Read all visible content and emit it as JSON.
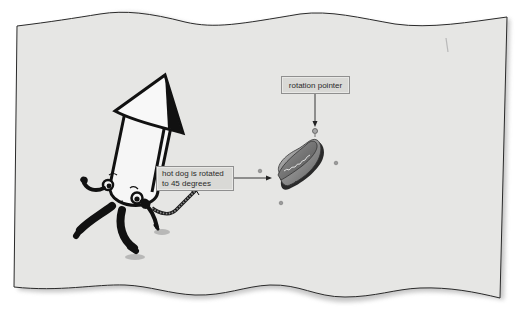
{
  "figure": {
    "paper_color": "#e6e6e4",
    "border_color": "#2a2a2a",
    "shadow_color": "#9a9a9a",
    "callouts": [
      {
        "id": "rotation",
        "label": "rotation pointer"
      },
      {
        "id": "hotdog",
        "lines": [
          "hot dog is rotated",
          "to 45 degrees"
        ]
      }
    ],
    "characters": [
      {
        "name": "firecracker-rocket",
        "description": "cartoon firecracker rocket with cone hat, eyes, arms, legs and lit fuse"
      },
      {
        "name": "hot-dog",
        "description": "hot dog in bun with mustard, rotated 45 degrees"
      }
    ],
    "selection_handles": 4,
    "rotation_degrees": 45
  }
}
